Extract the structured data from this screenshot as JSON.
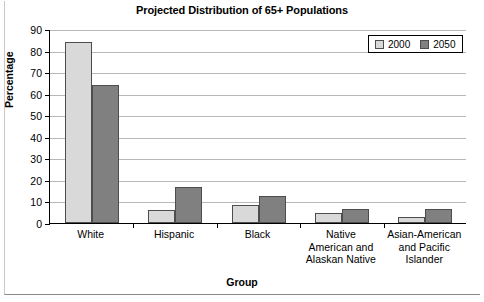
{
  "chart_data": {
    "type": "bar",
    "title": "Projected Distribution of 65+ Populations",
    "xlabel": "Group",
    "ylabel": "Percentage",
    "ylim": [
      0,
      90
    ],
    "ytick_step": 10,
    "yticks": [
      0,
      10,
      20,
      30,
      40,
      50,
      60,
      70,
      80,
      90
    ],
    "grid": true,
    "legend_position": "top-right",
    "categories": [
      "White",
      "Hispanic",
      "Black",
      "Native American and Alaskan Native",
      "Asian-American and Pacific Islander"
    ],
    "category_lines": [
      [
        "White"
      ],
      [
        "Hispanic"
      ],
      [
        "Black"
      ],
      [
        "Native",
        "American and",
        "Alaskan Native"
      ],
      [
        "Asian-American",
        "and Pacific",
        "Islander"
      ]
    ],
    "series": [
      {
        "name": "2000",
        "color": "#d9d9d9",
        "values": [
          84,
          6,
          8.5,
          4.5,
          3
        ]
      },
      {
        "name": "2050",
        "color": "#808080",
        "values": [
          64,
          16.5,
          12.5,
          6.5,
          6.5
        ]
      }
    ]
  },
  "colors": {
    "series_2000": "#d9d9d9",
    "series_2050": "#808080",
    "bar_outline": "#4d4d4d",
    "axis": "#000000",
    "gridline": "#b8b8b8",
    "background": "#ffffff"
  }
}
